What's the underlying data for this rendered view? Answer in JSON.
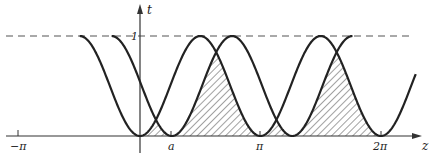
{
  "diagram": {
    "type": "function-plot",
    "axes": {
      "x_label": "z",
      "y_label": "t",
      "x_ticks": [
        {
          "label": "−π",
          "value": -3.14159
        },
        {
          "label": "a",
          "value": 0.83
        },
        {
          "label": "π",
          "value": 3.14159
        },
        {
          "label": "2π",
          "value": 6.28319
        }
      ],
      "y_ticks": [
        {
          "label": "1",
          "value": 1
        }
      ]
    },
    "curves": [
      {
        "name": "curve-1",
        "description": "t = sin² z style periodic curve, minima at 0, π, 2π, maxima at 1",
        "z_start": -1.5708,
        "z_end": 7.2,
        "shift": 0
      },
      {
        "name": "curve-2",
        "description": "same curve shifted right by a",
        "z_start": -0.74,
        "z_end": 5.54,
        "shift": 0.83
      }
    ],
    "dashed_line": {
      "t": 1,
      "label": "t = 1"
    },
    "shaded_region": {
      "description": "hatched area under the lower of the two curves",
      "z_from": 0,
      "z_to": 6.28319,
      "pattern": "diagonal-hatch"
    },
    "colors": {
      "curve": "#222222",
      "axis": "#333333",
      "hatch": "#444444",
      "dashed": "#555555"
    }
  }
}
